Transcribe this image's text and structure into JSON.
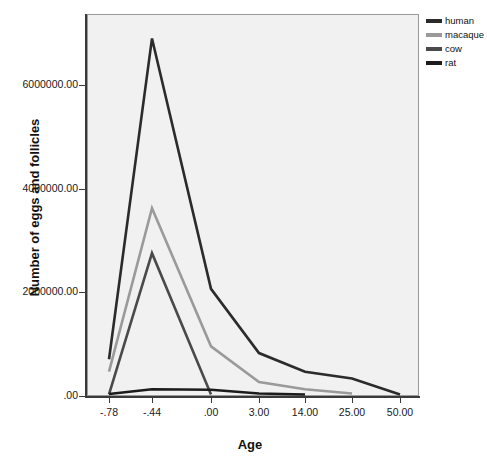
{
  "chart_data": {
    "type": "line",
    "title": "",
    "xlabel": "Age",
    "ylabel": "Number of eggs and follicles",
    "categories": [
      "-.78",
      "-.44",
      ".00",
      "3.00",
      "14.00",
      "25.00",
      "50.00"
    ],
    "ytick_labels": [
      "6000000.00",
      "4000000.00",
      "2000000.00",
      ".00"
    ],
    "ytick_values": [
      6000000,
      4000000,
      2000000,
      0
    ],
    "ylim": [
      0,
      7200000
    ],
    "grid": false,
    "legend_position": "top-right",
    "series": [
      {
        "name": "human",
        "color": "#2b2b2b",
        "values": [
          700000,
          6900000,
          2060000,
          820000,
          460000,
          330000,
          20000
        ]
      },
      {
        "name": "macaque",
        "color": "#9a9a9a",
        "values": [
          460000,
          3620000,
          950000,
          260000,
          120000,
          40000,
          null
        ]
      },
      {
        "name": "cow",
        "color": "#4a4a4a",
        "values": [
          20000,
          2750000,
          20000,
          null,
          null,
          null,
          null
        ]
      },
      {
        "name": "rat",
        "color": "#1c1c1c",
        "values": [
          30000,
          120000,
          110000,
          40000,
          20000,
          null,
          null
        ]
      }
    ]
  },
  "legend": {
    "items": [
      {
        "label": "human",
        "color": "#2b2b2b"
      },
      {
        "label": "macaque",
        "color": "#9a9a9a"
      },
      {
        "label": "cow",
        "color": "#4a4a4a"
      },
      {
        "label": "rat",
        "color": "#1c1c1c"
      }
    ]
  },
  "colors": {
    "plot_background": "#f1f1f1",
    "axis": "#3a3a3a",
    "text": "#111111",
    "page_background": "#ffffff"
  }
}
